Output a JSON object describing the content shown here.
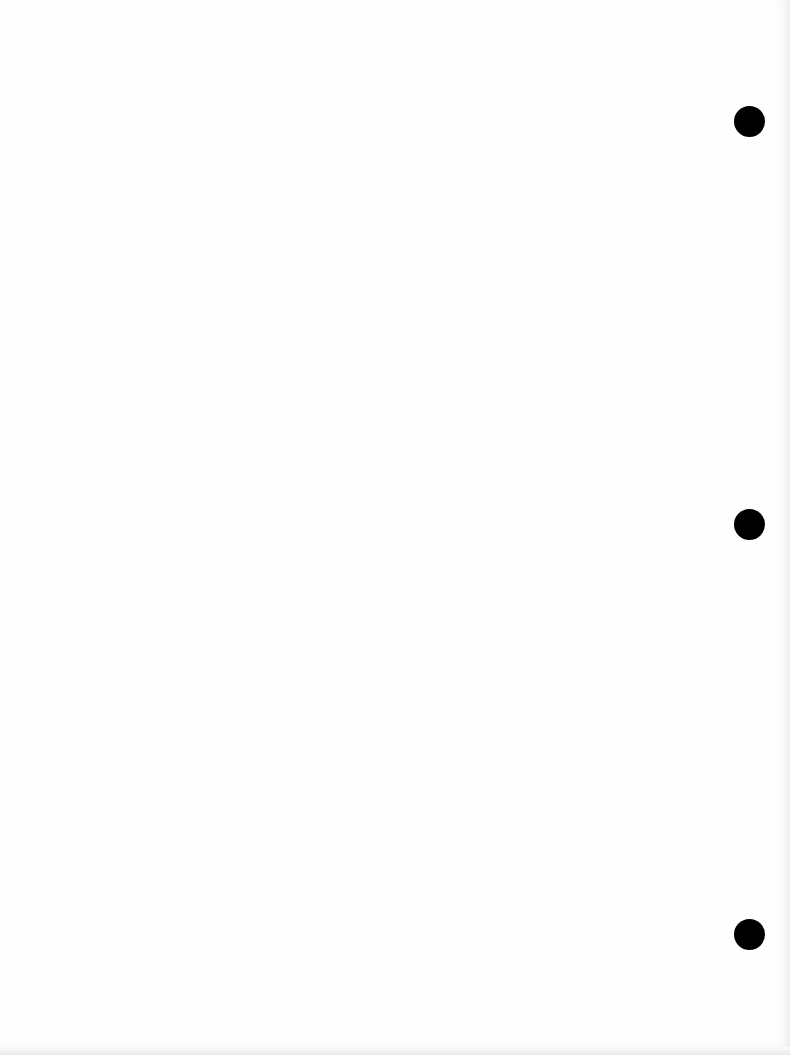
{
  "document": {
    "content": "",
    "punch_holes": [
      {
        "cx": 749,
        "cy": 121,
        "d": 31
      },
      {
        "cx": 749,
        "cy": 524,
        "d": 31
      },
      {
        "cx": 749,
        "cy": 934,
        "d": 31
      }
    ],
    "colors": {
      "paper": "#fefefe",
      "hole": "#000000",
      "edge": "#ededed"
    }
  }
}
